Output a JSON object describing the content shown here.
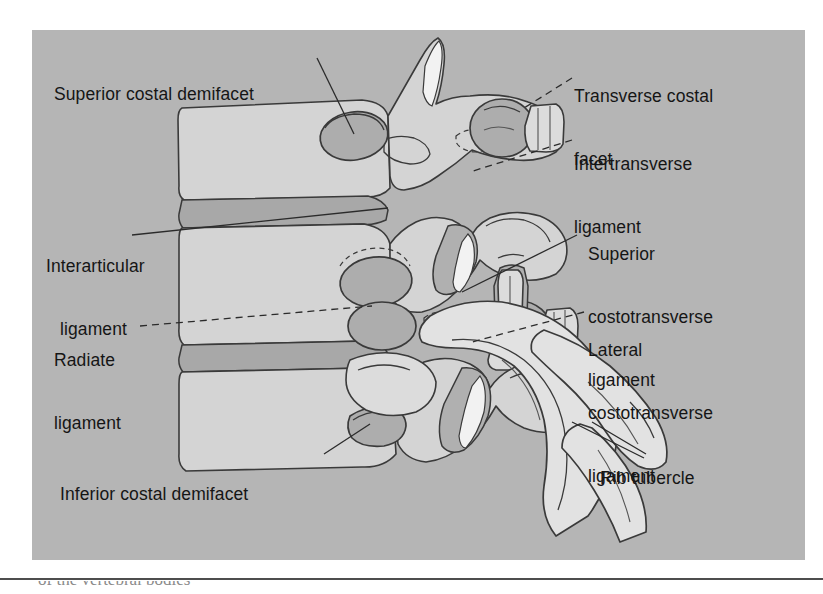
{
  "figure": {
    "name": "costovertebral-joint-ligaments-diagram",
    "type": "anatomical-illustration",
    "panel_background_color": "#b5b5b5",
    "bone_fill_color": "#d4d4d4",
    "disc_fill_color": "#a8a8a8",
    "outline_color": "#3a3a3a",
    "label_text_color": "#151515"
  },
  "labels": [
    {
      "id": "superior-costal-demifacet",
      "line1": "Superior costal demifacet",
      "line2": "",
      "leader": "solid"
    },
    {
      "id": "transverse-costal-facet",
      "line1": "Transverse costal",
      "line2": "facet",
      "leader": "dashed"
    },
    {
      "id": "intertransverse-ligament",
      "line1": "Intertransverse",
      "line2": "ligament",
      "leader": "dashed"
    },
    {
      "id": "interarticular-ligament",
      "line1": "Interarticular",
      "line2": "ligament",
      "leader": "solid"
    },
    {
      "id": "superior-costotransverse-ligament",
      "line1": "Superior",
      "line2": "costotransverse",
      "line3": "ligament",
      "leader": "solid"
    },
    {
      "id": "lateral-costotransverse-ligament",
      "line1": "Lateral",
      "line2": "costotransverse",
      "line3": "ligament",
      "leader": "dashed"
    },
    {
      "id": "radiate-ligament",
      "line1": "Radiate",
      "line2": "ligament",
      "leader": "dashed"
    },
    {
      "id": "inferior-costal-demifacet",
      "line1": "Inferior costal demifacet",
      "line2": "",
      "leader": "solid"
    },
    {
      "id": "rib-tubercle",
      "line1": "Rib tubercle",
      "line2": "",
      "leader": "solid"
    }
  ],
  "caption_clipped": "of the vertebral bodies"
}
